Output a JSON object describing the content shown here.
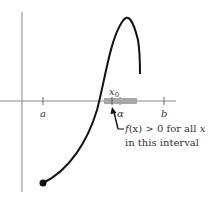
{
  "diagram": {
    "axis_labels": {
      "a": "a",
      "alpha": "α",
      "b": "b",
      "x0": "x",
      "x0_sub": "0"
    },
    "annotation": {
      "line1_f": "f",
      "line1_x": "(x)",
      "line1_rest": " > 0 for all ",
      "line1_var": "x",
      "line2": "in this interval"
    },
    "colors": {
      "curve": "#111111",
      "axes": "#777777",
      "interval_band": "#a8a8a8"
    }
  }
}
